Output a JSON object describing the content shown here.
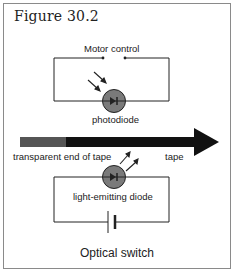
{
  "figure": {
    "title": "Figure 30.2",
    "caption": "Optical switch"
  },
  "labels": {
    "motor_control": "Motor control",
    "photodiode": "photodiode",
    "transparent_end": "transparent end of tape",
    "tape": "tape",
    "led": "light-emitting diode"
  },
  "colors": {
    "line": "#222222",
    "diode_fill": "#7a7a7a",
    "tape_dark": "#111111",
    "tape_transparent": "#555555",
    "border": "#8a8a8a"
  }
}
